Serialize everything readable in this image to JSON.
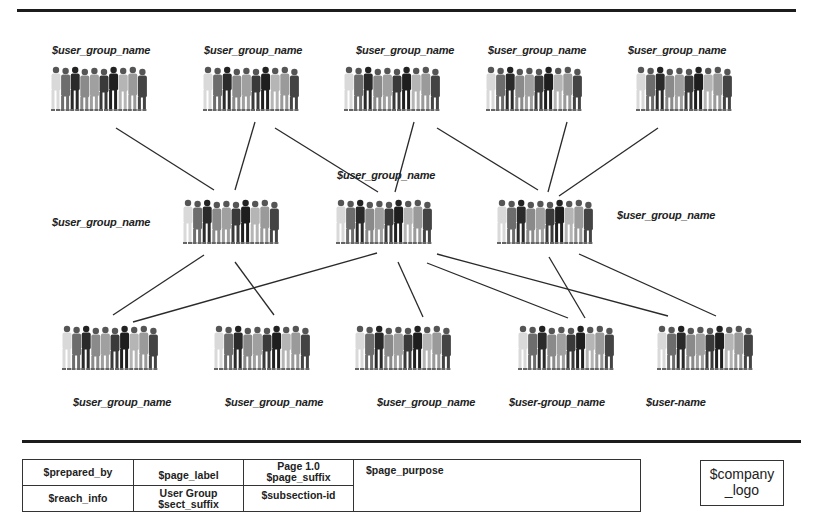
{
  "diagram": {
    "top_groups": [
      {
        "label": "$user_group_name",
        "icon": "people-group-icon"
      },
      {
        "label": "$user_group_name",
        "icon": "people-group-icon"
      },
      {
        "label": "$user_group_name",
        "icon": "people-group-icon"
      },
      {
        "label": "$user_group_name",
        "icon": "people-group-icon"
      },
      {
        "label": "$user_group_name",
        "icon": "people-group-icon"
      }
    ],
    "middle_groups": [
      {
        "label": "$user_group_name",
        "icon": "people-group-icon"
      },
      {
        "label": "$user_group_name",
        "icon": "people-group-icon"
      },
      {
        "label": "$user_group_name",
        "icon": "people-group-icon"
      }
    ],
    "bottom_groups": [
      {
        "label": "$user_group_name",
        "icon": "people-group-icon"
      },
      {
        "label": "$user_group_name",
        "icon": "people-group-icon"
      },
      {
        "label": "$user_group_name",
        "icon": "people-group-icon"
      },
      {
        "label": "$user-group_name",
        "icon": "people-group-icon"
      },
      {
        "label": "$user-name",
        "icon": "people-group-icon"
      }
    ],
    "connections": [
      {
        "from": "top.0",
        "to": "middle.0"
      },
      {
        "from": "top.1",
        "to": "middle.0"
      },
      {
        "from": "top.1",
        "to": "middle.1"
      },
      {
        "from": "top.2",
        "to": "middle.1"
      },
      {
        "from": "top.2",
        "to": "middle.2"
      },
      {
        "from": "top.3",
        "to": "middle.2"
      },
      {
        "from": "top.4",
        "to": "middle.2"
      },
      {
        "from": "middle.0",
        "to": "bottom.0"
      },
      {
        "from": "middle.0",
        "to": "bottom.1"
      },
      {
        "from": "middle.1",
        "to": "bottom.0"
      },
      {
        "from": "middle.1",
        "to": "bottom.2"
      },
      {
        "from": "middle.1",
        "to": "bottom.3"
      },
      {
        "from": "middle.1",
        "to": "bottom.4"
      },
      {
        "from": "middle.2",
        "to": "bottom.3"
      },
      {
        "from": "middle.2",
        "to": "bottom.4"
      }
    ]
  },
  "footer": {
    "prepared_by": "$prepared_by",
    "page_label": "$page_label",
    "page_number": "Page 1.0",
    "page_suffix": "$page_suffix",
    "page_purpose": "$page_purpose",
    "reach_info": "$reach_info",
    "section_name": "User Group",
    "sect_suffix": "$sect_suffix",
    "subsection_id": "$subsection-id",
    "company_logo_line1": "$company",
    "company_logo_line2": "_logo"
  }
}
